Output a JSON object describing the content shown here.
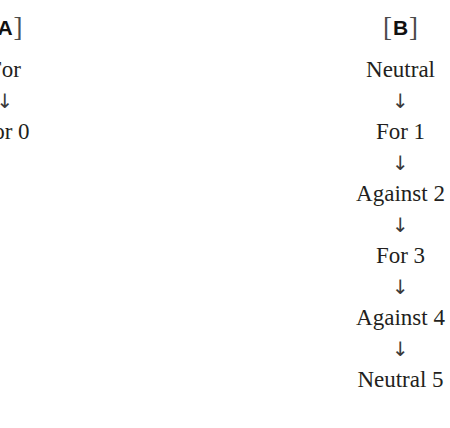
{
  "figure": {
    "background_color": "#ffffff",
    "text_color": "#231f20",
    "arrow_glyph": "↓",
    "bracket_open": "[",
    "bracket_close": "]"
  },
  "panels": [
    {
      "id": "panel-a",
      "label_letter": "A",
      "sequence": [
        "For",
        "For 0"
      ]
    },
    {
      "id": "panel-b",
      "label_letter": "B",
      "sequence": [
        "Neutral",
        "For 1",
        "Against 2",
        "For 3",
        "Against 4",
        "Neutral 5"
      ]
    }
  ]
}
